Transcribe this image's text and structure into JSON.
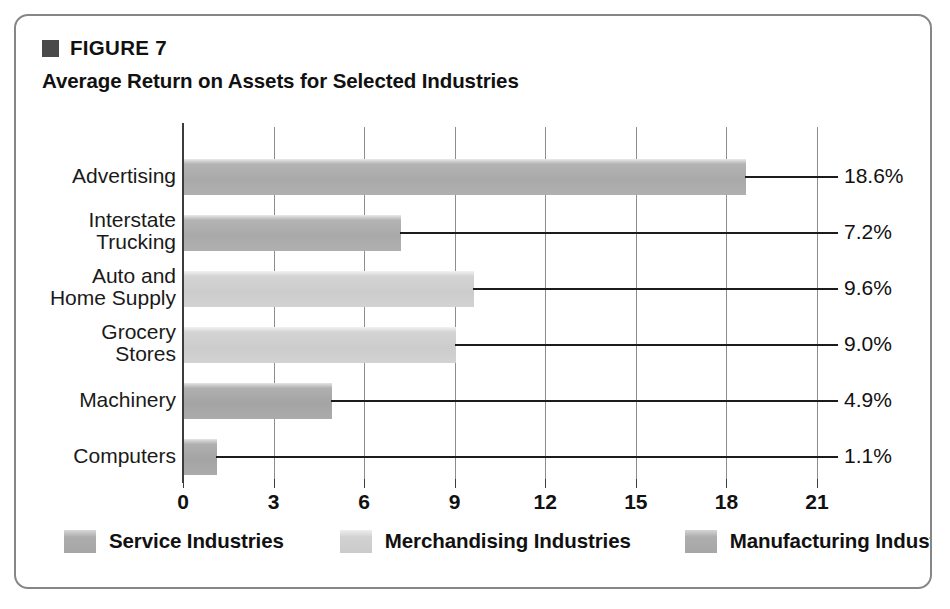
{
  "figure": {
    "marker_icon": "filled-square-icon",
    "number": "FIGURE 7",
    "title": "Average Return on Assets for Selected Industries"
  },
  "chart_data": {
    "type": "bar",
    "orientation": "horizontal",
    "title": "Average Return on Assets for Selected Industries",
    "xlabel": "",
    "ylabel": "",
    "xlim": [
      0,
      21
    ],
    "grid": true,
    "legend_position": "bottom",
    "categories": [
      "Advertising",
      "Interstate Trucking",
      "Auto and Home Supply",
      "Grocery Stores",
      "Machinery",
      "Computers"
    ],
    "category_lines": [
      [
        "Advertising"
      ],
      [
        "Interstate",
        "Trucking"
      ],
      [
        "Auto and",
        "Home Supply"
      ],
      [
        "Grocery",
        "Stores"
      ],
      [
        "Machinery"
      ],
      [
        "Computers"
      ]
    ],
    "values": [
      18.6,
      7.2,
      9.6,
      9.0,
      4.9,
      1.1
    ],
    "value_labels": [
      "18.6%",
      "7.2%",
      "9.6%",
      "9.0%",
      "4.9%",
      "1.1%"
    ],
    "group_keys": [
      "service",
      "service",
      "merch",
      "merch",
      "manuf",
      "manuf"
    ],
    "xticks": [
      0,
      3,
      6,
      9,
      12,
      15,
      18,
      21
    ],
    "xtick_labels": [
      "0",
      "3",
      "6",
      "9",
      "12",
      "15",
      "18",
      "21"
    ],
    "legend": [
      {
        "key": "service",
        "label": "Service Industries",
        "color": "#a9a9a9"
      },
      {
        "key": "merch",
        "label": "Merchandising Industries",
        "color": "#cccccc"
      },
      {
        "key": "manuf",
        "label": "Manufacturing Industries",
        "color": "#a4a4a4"
      }
    ]
  },
  "colors": {
    "frame": "#868686",
    "axis": "#3c3c3c",
    "gridline": "#8d8d8d",
    "text": "#111111",
    "marker": "#4a4a4a"
  }
}
